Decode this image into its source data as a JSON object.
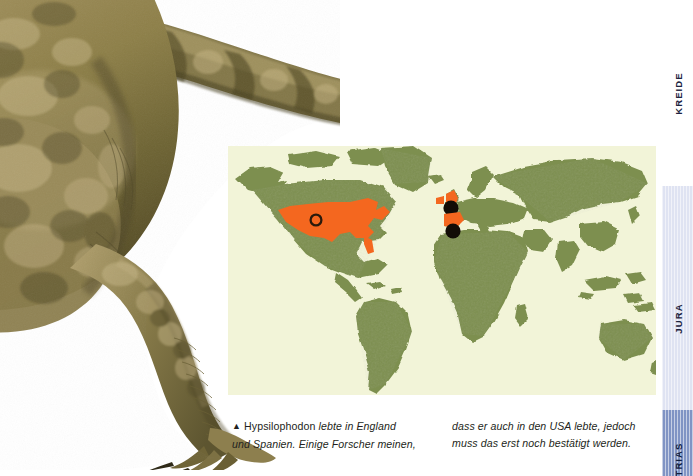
{
  "page": {
    "width": 693,
    "height": 476,
    "background": "#ffffff"
  },
  "figure": {
    "name": "hypsilophodon-photo",
    "subject": "Hypsilophodon",
    "colors": {
      "skin_light": "#c0a974",
      "skin_mid": "#8f7e4c",
      "skin_dark": "#5e5630",
      "shadow": "#463f22"
    }
  },
  "map": {
    "name": "world-distribution-map",
    "title": "",
    "ocean_color": "#f2f4d8",
    "land_color": "#7d8f50",
    "land_shade": "#5f7038",
    "highlight_color": "#f4671f",
    "marker_color": "#1a1208",
    "markers": [
      {
        "id": "usa-marker",
        "label": "USA",
        "type": "ring",
        "x": 316,
        "y": 220
      },
      {
        "id": "england-marker",
        "label": "England",
        "type": "dot",
        "x": 451,
        "y": 208
      },
      {
        "id": "spain-marker",
        "label": "Spanien",
        "type": "dot",
        "x": 453,
        "y": 231
      }
    ],
    "highlighted_regions": [
      "USA",
      "England",
      "Spanien"
    ]
  },
  "caption": {
    "marker_glyph": "▲",
    "left_column": {
      "line1_roman": "Hypsilophodon",
      "line1_italic": "lebte in England",
      "line2_italic": "und Spanien. Einige Forscher meinen,"
    },
    "right_column": {
      "line1_italic": "dass er auch in den USA lebte, jedoch",
      "line2_italic": "muss das erst noch bestätigt werden."
    }
  },
  "sidebar": {
    "name": "geologic-period-tabs",
    "bands": [
      {
        "id": "kreide",
        "label": "KREIDE",
        "color": "#ffffff"
      },
      {
        "id": "jura",
        "label": "JURA",
        "color": "#dfe3f2"
      },
      {
        "id": "trias",
        "label": "TRIAS",
        "color": "#8094c4"
      }
    ]
  }
}
